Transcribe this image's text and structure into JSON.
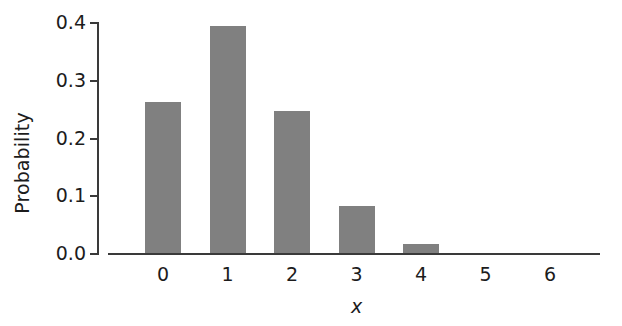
{
  "chart_data": {
    "type": "bar",
    "title": "",
    "subtitle": "",
    "xlabel": "x",
    "ylabel": "Probability",
    "categories": [
      "0",
      "1",
      "2",
      "3",
      "4",
      "5",
      "6"
    ],
    "values": [
      0.262,
      0.393,
      0.246,
      0.082,
      0.015,
      0.0,
      0.0
    ],
    "xlim": [
      -0.5,
      6.5
    ],
    "ylim": [
      0.0,
      0.4
    ],
    "y_ticks": [
      "0.0",
      "0.1",
      "0.2",
      "0.3",
      "0.4"
    ],
    "y_tick_values": [
      0.0,
      0.1,
      0.2,
      0.3,
      0.4
    ],
    "x_ticks": [
      "0",
      "1",
      "2",
      "3",
      "4",
      "5",
      "6"
    ],
    "grid": false,
    "legend": false,
    "legend_position": "none",
    "bar_color": "#808080",
    "axis_color": "#3a3a3a",
    "text_color": "#1c1c1c",
    "background_color": "#ffffff"
  }
}
